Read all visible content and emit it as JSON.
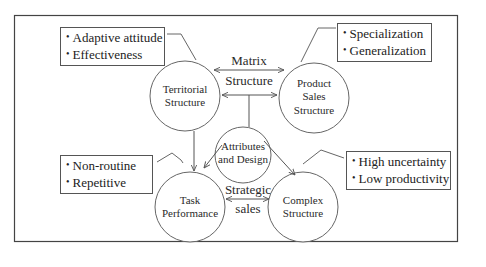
{
  "diagram": {
    "nodes": [
      {
        "id": "territorial",
        "label_lines": [
          "Territorial",
          "Structure"
        ]
      },
      {
        "id": "product_sales",
        "label_lines": [
          "Product",
          "Sales",
          "Structure"
        ]
      },
      {
        "id": "attributes",
        "label_lines": [
          "Attributes",
          "and Design"
        ]
      },
      {
        "id": "task_performance",
        "label_lines": [
          "Task",
          "Performance"
        ]
      },
      {
        "id": "complex",
        "label_lines": [
          "Complex",
          "Structure"
        ]
      }
    ],
    "edges": [
      {
        "from": "territorial",
        "to": "product_sales",
        "type": "bidirectional",
        "label_lines": [
          "Matrix",
          "Structure"
        ]
      },
      {
        "from": "attributes",
        "to": "territorial",
        "type": "arrow"
      },
      {
        "from": "attributes",
        "to": "product_sales",
        "type": "arrow"
      },
      {
        "from": "territorial",
        "to": "task_performance",
        "type": "arrow"
      },
      {
        "from": "attributes",
        "to": "task_performance",
        "type": "arrow"
      },
      {
        "from": "attributes",
        "to": "complex",
        "type": "arrow"
      },
      {
        "from": "task_performance",
        "to": "complex",
        "type": "bidirectional",
        "label_lines": [
          "Strategic",
          "sales"
        ]
      }
    ],
    "callouts": [
      {
        "attached_to": "territorial",
        "items": [
          "Adaptive attitude",
          "Effectiveness"
        ]
      },
      {
        "attached_to": "product_sales",
        "items": [
          "Specialization",
          "Generalization"
        ]
      },
      {
        "attached_to": "task_performance",
        "items": [
          "Non-routine",
          "Repetitive"
        ]
      },
      {
        "attached_to": "complex",
        "items": [
          "High uncertainty",
          "Low productivity"
        ]
      }
    ],
    "bullet_glyph": "•",
    "colors": {
      "line": "#555555",
      "frame": "#444444",
      "text": "#222222",
      "background": "#ffffff"
    }
  }
}
